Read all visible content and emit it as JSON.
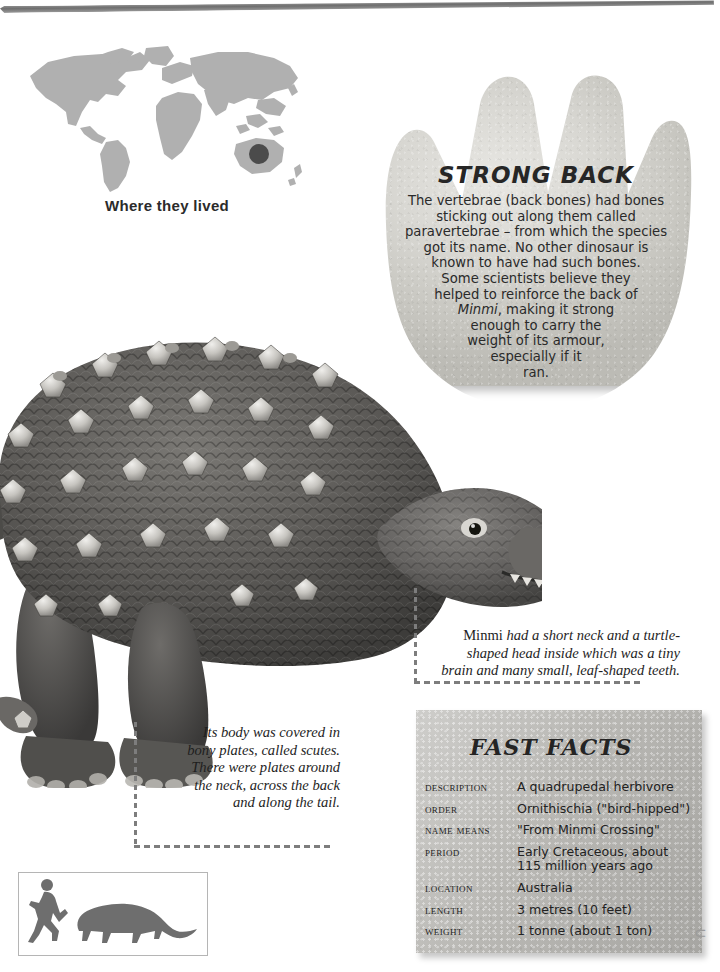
{
  "page": {
    "background_color": "#ffffff",
    "rule_color": "#6f6f6f"
  },
  "map": {
    "caption": "Where they lived",
    "land_color": "#b0b0b0",
    "marker_color": "#4b4b4b",
    "marker_region": "Australia"
  },
  "footprint_panel": {
    "shape": "three-clawed-footprint",
    "fill_color": "#d8d7d2",
    "title": "STRONG BACK",
    "body_lines": [
      "The vertebrae (back bones) had bones",
      "sticking out along them called",
      "paravertebrae – from which the species",
      "got its name. No other dinosaur is",
      "known to have had such bones.",
      "Some scientists believe they",
      "helped to reinforce the back of"
    ],
    "italic_word": "Minmi",
    "body_lines_after": [
      ", making it strong",
      "enough to carry the",
      "weight of its armour,",
      "especially if it",
      "ran."
    ]
  },
  "callouts": [
    {
      "id": "head-callout",
      "lead_word": "Minmi",
      "lines": [
        " had a short neck and a turtle-",
        "shaped head inside which was a tiny",
        "brain and many small, leaf-shaped teeth."
      ]
    },
    {
      "id": "scutes-callout",
      "lines": [
        "Its body was covered in",
        "bony plates, called scutes.",
        "There were plates around",
        "the neck, across the back",
        "and along the tail."
      ]
    }
  ],
  "fast_facts": {
    "title": "FAST FACTS",
    "panel_color": "#b9b8b4",
    "rows": [
      {
        "label": "Description",
        "value": "A quadrupedal herbivore"
      },
      {
        "label": "Order",
        "value": "Ornithischia (\"bird-hipped\")"
      },
      {
        "label": "Name means",
        "value": "\"From Minmi Crossing\""
      },
      {
        "label": "Period",
        "value": "Early Cretaceous, about\n115 million years ago"
      },
      {
        "label": "Location",
        "value": "Australia"
      },
      {
        "label": "Length",
        "value": "3 metres (10 feet)"
      },
      {
        "label": "Weight",
        "value": "1 tonne (about 1 ton)"
      }
    ]
  },
  "scale_box": {
    "silhouettes": [
      "running-human",
      "minmi-dinosaur"
    ],
    "fill_color": "#6e6e6e"
  },
  "illustration": {
    "subject": "Minmi armoured dinosaur",
    "body_color": "#5a5a5a",
    "scute_color": "#cfcdc8"
  },
  "corner": {
    "curl_glyph": "⊂"
  }
}
